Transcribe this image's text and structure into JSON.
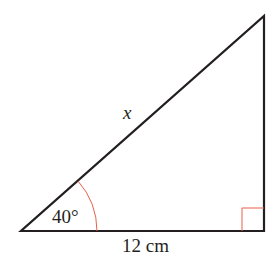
{
  "diagram": {
    "type": "right-triangle",
    "hypotenuse_label": "x",
    "angle_label": "40°",
    "base_label": "12 cm",
    "colors": {
      "line": "#231f20",
      "angle_marker": "#e8604a",
      "background": "#ffffff"
    }
  }
}
